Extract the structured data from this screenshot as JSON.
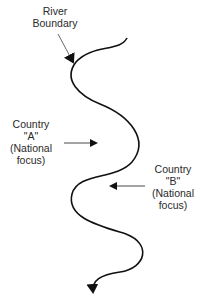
{
  "labels": {
    "river": [
      "River",
      "Boundary"
    ],
    "country_a": [
      "Country",
      "\"A\"",
      "(National",
      "focus)"
    ],
    "country_b": [
      "Country",
      "\"B\"",
      "(National",
      "focus)"
    ]
  },
  "colors": {
    "line": "#111111",
    "text": "#2a2a2a",
    "background": "#ffffff"
  }
}
